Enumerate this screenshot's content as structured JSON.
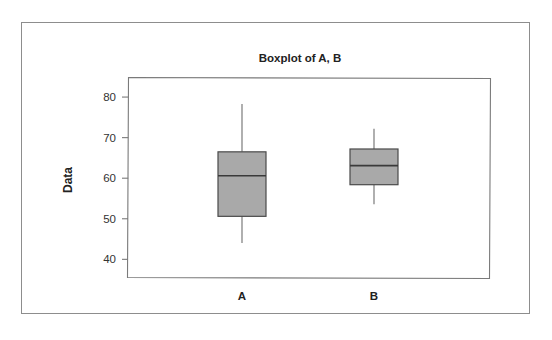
{
  "figure": {
    "background_color": "#ffffff",
    "frame_color": "#8d8d8d"
  },
  "chart_data": {
    "type": "box",
    "title": "Boxplot of A, B",
    "xlabel": "",
    "ylabel": "Data",
    "categories": [
      "A",
      "B"
    ],
    "ytick_labels": [
      "40",
      "50",
      "60",
      "70",
      "80"
    ],
    "yticks": [
      40,
      50,
      60,
      70,
      80
    ],
    "ylim": [
      35.4,
      84.7
    ],
    "grid": false,
    "legend": null,
    "box_fill_color": "#a9a9a9",
    "box_edge_color": "#4a4a4a",
    "median_color": "#3a3a3a",
    "whisker_color": "#6e6e6e",
    "boxes": [
      {
        "name": "A",
        "whisker_low": 44.0,
        "q1": 50.6,
        "median": 60.6,
        "q3": 66.5,
        "whisker_high": 78.3,
        "outliers": []
      },
      {
        "name": "B",
        "whisker_low": 53.6,
        "q1": 58.4,
        "median": 63.1,
        "q3": 67.2,
        "whisker_high": 72.2,
        "outliers": []
      }
    ]
  },
  "axis": {
    "y_title": "Data",
    "tick_40": "40",
    "tick_50": "50",
    "tick_60": "60",
    "tick_70": "70",
    "tick_80": "80"
  },
  "xlabels": {
    "a": "A",
    "b": "B"
  },
  "title": {
    "text": "Boxplot of A, B"
  }
}
